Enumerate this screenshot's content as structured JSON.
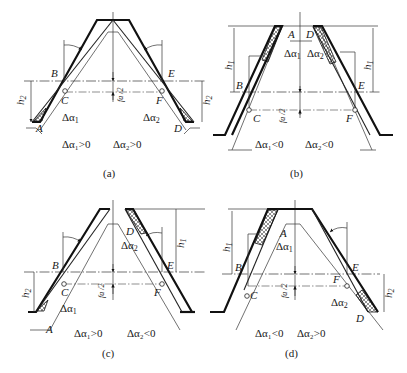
{
  "figure": {
    "panels": [
      {
        "id": "a",
        "caption": "(a)",
        "points": {
          "A": "A",
          "B": "B",
          "C": "C",
          "D": "D",
          "E": "E",
          "F": "F"
        },
        "delta_left": "Δα",
        "delta_left_sub": "1",
        "delta_right": "Δα",
        "delta_right_sub": "2",
        "height_left": "h",
        "height_left_sub": "2",
        "height_right": "h",
        "height_right_sub": "2",
        "half_pitch_num": "f",
        "half_pitch_num_sub": "a",
        "half_pitch_den": "2",
        "condition_left": "Δα₁>0",
        "condition_right": "Δα₂>0"
      },
      {
        "id": "b",
        "caption": "(b)",
        "points": {
          "A": "A",
          "B": "B",
          "C": "C",
          "D": "D",
          "E": "E",
          "F": "F"
        },
        "delta_left": "Δα",
        "delta_left_sub": "1",
        "delta_right": "Δα",
        "delta_right_sub": "2",
        "height_left": "h",
        "height_left_sub": "1",
        "height_right": "h",
        "height_right_sub": "1",
        "half_pitch_num": "f",
        "half_pitch_num_sub": "a",
        "half_pitch_den": "2",
        "condition_left": "Δα₁<0",
        "condition_right": "Δα₂<0"
      },
      {
        "id": "c",
        "caption": "(c)",
        "points": {
          "A": "A",
          "B": "B",
          "C": "C",
          "D": "D",
          "E": "E",
          "F": "F"
        },
        "delta_left": "Δα",
        "delta_left_sub": "1",
        "delta_right": "Δα",
        "delta_right_sub": "2",
        "height_left": "h",
        "height_left_sub": "2",
        "height_right": "h",
        "height_right_sub": "1",
        "half_pitch_num": "f",
        "half_pitch_num_sub": "a",
        "half_pitch_den": "2",
        "condition_left": "Δα₁>0",
        "condition_right": "Δα₂<0"
      },
      {
        "id": "d",
        "caption": "(d)",
        "points": {
          "A": "A",
          "B": "B",
          "C": "C",
          "D": "D",
          "E": "E",
          "F": "F"
        },
        "delta_left": "Δα",
        "delta_left_sub": "1",
        "delta_right": "Δα",
        "delta_right_sub": "2",
        "height_left": "h",
        "height_left_sub": "1",
        "height_right": "h",
        "height_right_sub": "2",
        "half_pitch_num": "f",
        "half_pitch_num_sub": "a",
        "half_pitch_den": "2",
        "condition_left": "Δα₁<0",
        "condition_right": "Δα₂>0"
      }
    ]
  }
}
